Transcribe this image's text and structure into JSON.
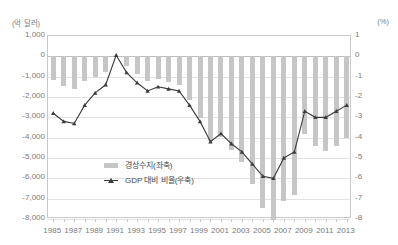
{
  "chart_data": {
    "type": "bar",
    "title": "",
    "xlabel": "",
    "ylabel": "",
    "left_axis": {
      "unit_label": "(억 달러)",
      "ticks": [
        "1,000",
        "0",
        "-1,000",
        "-2,000",
        "-3,000",
        "-4,000",
        "-5,000",
        "-6,000",
        "-7,000",
        "-8,000"
      ],
      "ylim": [
        -8000,
        1000
      ]
    },
    "right_axis": {
      "unit_label": "(%)",
      "ticks": [
        "1",
        "0",
        "-1",
        "-2",
        "-3",
        "-4",
        "-5",
        "-6",
        "-7",
        "-8"
      ],
      "ylim": [
        -8,
        1
      ]
    },
    "grid": true,
    "legend_position": "inside-center",
    "categories": [
      "1985",
      "1986",
      "1987",
      "1988",
      "1989",
      "1990",
      "1991",
      "1992",
      "1993",
      "1994",
      "1995",
      "1996",
      "1997",
      "1998",
      "1999",
      "2000",
      "2001",
      "2002",
      "2003",
      "2004",
      "2005",
      "2006",
      "2007",
      "2008",
      "2009",
      "2010",
      "2011",
      "2012",
      "2013"
    ],
    "xtick_labels": [
      "1985",
      "1987",
      "1989",
      "1991",
      "1993",
      "1995",
      "1997",
      "1999",
      "2001",
      "2003",
      "2005",
      "2007",
      "2009",
      "2011",
      "2013"
    ],
    "series": [
      {
        "name": "경상수지(좌축)",
        "type": "bar",
        "axis": "left",
        "color": "#c6c6c6",
        "values": [
          -1181,
          -1473,
          -1607,
          -1213,
          -993,
          -790,
          28,
          -500,
          -849,
          -1218,
          -1138,
          -1247,
          -1406,
          -2155,
          -3016,
          -4163,
          -3966,
          -4585,
          -5192,
          -6289,
          -7453,
          -8066,
          -7128,
          -6815,
          -3817,
          -4420,
          -4659,
          -4405,
          -4003
        ]
      },
      {
        "name": "GDP 대비 비율(우축)",
        "type": "line",
        "axis": "right",
        "color": "#3b3b3b",
        "marker": "triangle",
        "values": [
          -2.8,
          -3.2,
          -3.3,
          -2.4,
          -1.8,
          -1.4,
          0.05,
          -0.8,
          -1.3,
          -1.7,
          -1.5,
          -1.6,
          -1.7,
          -2.4,
          -3.2,
          -4.2,
          -3.8,
          -4.3,
          -4.7,
          -5.3,
          -5.9,
          -6.0,
          -5.0,
          -4.7,
          -2.7,
          -3.0,
          -3.0,
          -2.7,
          -2.4
        ]
      }
    ],
    "legend": [
      {
        "label": "경상수지(좌축)",
        "marker": "bar",
        "color": "#c6c6c6"
      },
      {
        "label": "GDP 대비 비율(우축)",
        "marker": "line-triangle",
        "color": "#3b3b3b"
      }
    ]
  }
}
